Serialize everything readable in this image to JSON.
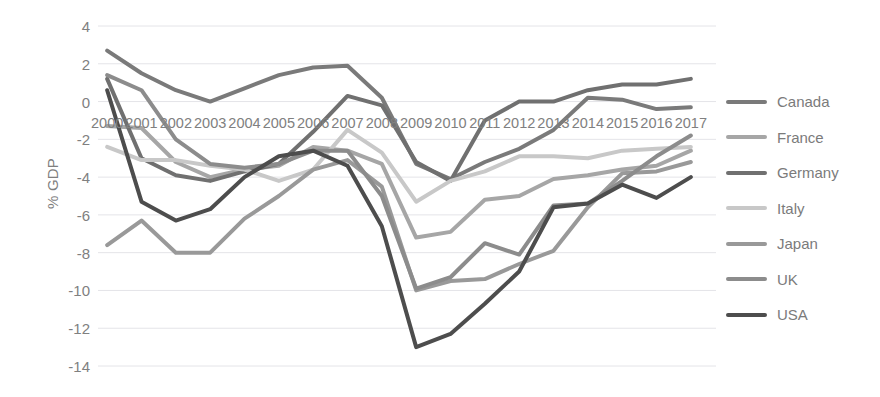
{
  "chart_data": {
    "type": "line",
    "title": "",
    "xlabel": "",
    "ylabel": "% GDP",
    "ylim": [
      -14,
      4
    ],
    "ytick_step": 2,
    "grid": true,
    "legend_position": "right",
    "categories": [
      "2000",
      "2001",
      "2002",
      "2003",
      "2004",
      "2005",
      "2006",
      "2007",
      "2008",
      "2009",
      "2010",
      "2011",
      "2012",
      "2013",
      "2014",
      "2015",
      "2016",
      "2017"
    ],
    "ytick_labels": [
      "4",
      "2",
      "0",
      "-2",
      "-4",
      "-6",
      "-8",
      "-10",
      "-12",
      "-14"
    ],
    "series": [
      {
        "name": "Canada",
        "color": "#7a7a7a",
        "values": [
          2.7,
          1.5,
          0.6,
          0.0,
          0.7,
          1.4,
          1.8,
          1.9,
          0.2,
          -3.3,
          -4.1,
          -3.2,
          -2.5,
          -1.5,
          0.2,
          0.1,
          -0.4,
          -0.3
        ]
      },
      {
        "name": "France",
        "color": "#a6a6a6",
        "values": [
          -1.3,
          -1.4,
          -3.2,
          -4.0,
          -3.6,
          -3.4,
          -2.4,
          -2.6,
          -3.3,
          -7.2,
          -6.9,
          -5.2,
          -5.0,
          -4.1,
          -3.9,
          -3.6,
          -3.4,
          -2.6
        ]
      },
      {
        "name": "Germany",
        "color": "#707070",
        "values": [
          1.2,
          -3.0,
          -3.9,
          -4.2,
          -3.7,
          -3.3,
          -1.6,
          0.3,
          -0.2,
          -3.2,
          -4.2,
          -1.0,
          0.0,
          0.0,
          0.6,
          0.9,
          0.9,
          1.2
        ]
      },
      {
        "name": "Italy",
        "color": "#c8c8c8",
        "values": [
          -2.4,
          -3.1,
          -3.1,
          -3.4,
          -3.6,
          -4.2,
          -3.6,
          -1.5,
          -2.7,
          -5.3,
          -4.2,
          -3.7,
          -2.9,
          -2.9,
          -3.0,
          -2.6,
          -2.5,
          -2.4
        ]
      },
      {
        "name": "Japan",
        "color": "#999999",
        "values": [
          -7.6,
          -6.3,
          -8.0,
          -8.0,
          -6.2,
          -5.0,
          -3.6,
          -3.1,
          -4.5,
          -10.0,
          -9.5,
          -9.4,
          -8.6,
          -7.9,
          -5.6,
          -3.8,
          -3.7,
          -3.2
        ]
      },
      {
        "name": "UK",
        "color": "#8c8c8c",
        "values": [
          1.4,
          0.6,
          -2.0,
          -3.3,
          -3.5,
          -3.3,
          -2.6,
          -2.6,
          -5.0,
          -9.9,
          -9.3,
          -7.5,
          -8.1,
          -5.5,
          -5.4,
          -4.2,
          -2.9,
          -1.8
        ]
      },
      {
        "name": "USA",
        "color": "#4d4d4d",
        "values": [
          0.6,
          -5.3,
          -6.3,
          -5.7,
          -4.0,
          -2.9,
          -2.6,
          -3.4,
          -6.6,
          -13.0,
          -12.3,
          -10.7,
          -9.0,
          -5.6,
          -5.4,
          -4.4,
          -5.1,
          -4.0
        ]
      }
    ]
  },
  "legend": {
    "items": [
      {
        "label": "Canada"
      },
      {
        "label": "France"
      },
      {
        "label": "Germany"
      },
      {
        "label": "Italy"
      },
      {
        "label": "Japan"
      },
      {
        "label": "UK"
      },
      {
        "label": "USA"
      }
    ]
  }
}
